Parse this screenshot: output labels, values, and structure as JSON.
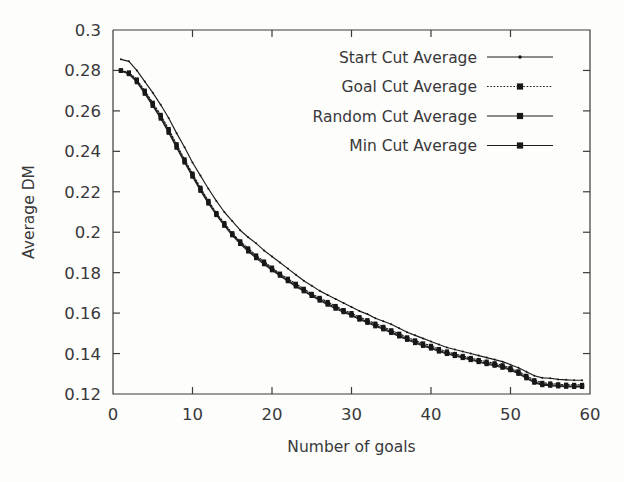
{
  "chart_data": {
    "type": "line",
    "title": "",
    "xlabel": "Number of goals",
    "ylabel": "Average DM",
    "xlim": [
      0,
      60
    ],
    "ylim": [
      0.12,
      0.3
    ],
    "xticks": [
      "0",
      "10",
      "20",
      "30",
      "40",
      "50",
      "60"
    ],
    "xtick_values": [
      0,
      10,
      20,
      30,
      40,
      50,
      60
    ],
    "yticks": [
      "0.12",
      "0.14",
      "0.16",
      "0.18",
      "0.2",
      "0.22",
      "0.24",
      "0.26",
      "0.28",
      "0.3"
    ],
    "ytick_values": [
      0.12,
      0.14,
      0.16,
      0.18,
      0.2,
      0.22,
      0.24,
      0.26,
      0.28,
      0.3
    ],
    "grid": false,
    "legend_position": "top-right",
    "x": [
      1,
      2,
      3,
      4,
      5,
      6,
      7,
      8,
      9,
      10,
      11,
      12,
      13,
      14,
      15,
      16,
      17,
      18,
      19,
      20,
      21,
      22,
      23,
      24,
      25,
      26,
      27,
      28,
      29,
      30,
      31,
      32,
      33,
      34,
      35,
      36,
      37,
      38,
      39,
      40,
      41,
      42,
      43,
      44,
      45,
      46,
      47,
      48,
      49,
      50,
      51,
      52,
      53,
      54,
      55,
      56,
      57,
      58,
      59
    ],
    "series": [
      {
        "name": "Start Cut Average",
        "line_style": "solid",
        "marker": "small-dot",
        "values": [
          0.2855,
          0.2845,
          0.28,
          0.2745,
          0.269,
          0.263,
          0.2565,
          0.249,
          0.242,
          0.2345,
          0.228,
          0.2215,
          0.2155,
          0.21,
          0.2055,
          0.201,
          0.1975,
          0.1945,
          0.191,
          0.188,
          0.185,
          0.182,
          0.179,
          0.176,
          0.1735,
          0.171,
          0.169,
          0.167,
          0.165,
          0.163,
          0.161,
          0.1595,
          0.1575,
          0.156,
          0.1545,
          0.1525,
          0.1505,
          0.149,
          0.1475,
          0.146,
          0.1445,
          0.143,
          0.142,
          0.141,
          0.14,
          0.139,
          0.138,
          0.137,
          0.136,
          0.1345,
          0.133,
          0.131,
          0.129,
          0.128,
          0.1278,
          0.1272,
          0.127,
          0.1268,
          0.1268
        ]
      },
      {
        "name": "Goal Cut Average",
        "line_style": "dotted",
        "marker": "square",
        "values": [
          0.28,
          0.279,
          0.2755,
          0.27,
          0.264,
          0.258,
          0.251,
          0.2435,
          0.236,
          0.229,
          0.222,
          0.2155,
          0.2095,
          0.2045,
          0.1995,
          0.1955,
          0.192,
          0.1885,
          0.1855,
          0.1825,
          0.1795,
          0.177,
          0.1745,
          0.172,
          0.1695,
          0.1675,
          0.1655,
          0.1635,
          0.1615,
          0.16,
          0.158,
          0.1565,
          0.1548,
          0.1532,
          0.1515,
          0.1498,
          0.148,
          0.1465,
          0.145,
          0.1438,
          0.1422,
          0.141,
          0.1398,
          0.1388,
          0.1378,
          0.1368,
          0.136,
          0.1352,
          0.1342,
          0.1328,
          0.1312,
          0.129,
          0.1268,
          0.1255,
          0.1252,
          0.1248,
          0.1246,
          0.1245,
          0.1245
        ]
      },
      {
        "name": "Random Cut Average",
        "line_style": "solid",
        "marker": "square",
        "values": [
          0.28,
          0.2785,
          0.2748,
          0.2692,
          0.2632,
          0.257,
          0.25,
          0.2425,
          0.2352,
          0.2282,
          0.2212,
          0.2148,
          0.209,
          0.2038,
          0.199,
          0.1948,
          0.1912,
          0.1878,
          0.1848,
          0.1818,
          0.179,
          0.1762,
          0.1738,
          0.1712,
          0.1688,
          0.1668,
          0.1648,
          0.1628,
          0.161,
          0.1592,
          0.1572,
          0.1558,
          0.154,
          0.1525,
          0.1508,
          0.149,
          0.1472,
          0.1458,
          0.1442,
          0.143,
          0.1415,
          0.1402,
          0.1392,
          0.1382,
          0.1372,
          0.1362,
          0.1352,
          0.1345,
          0.1335,
          0.1322,
          0.1305,
          0.1282,
          0.126,
          0.1248,
          0.1245,
          0.1242,
          0.124,
          0.1238,
          0.1238
        ]
      },
      {
        "name": "Min Cut Average",
        "line_style": "solid",
        "marker": "square",
        "values": [
          0.2798,
          0.2782,
          0.2742,
          0.2685,
          0.2625,
          0.2562,
          0.2492,
          0.2418,
          0.2345,
          0.2275,
          0.2205,
          0.2142,
          0.2085,
          0.2032,
          0.1985,
          0.1942,
          0.1905,
          0.1872,
          0.1842,
          0.1812,
          0.1785,
          0.1758,
          0.1732,
          0.1708,
          0.1685,
          0.1662,
          0.1642,
          0.1622,
          0.1605,
          0.1588,
          0.1568,
          0.1552,
          0.1535,
          0.152,
          0.1502,
          0.1485,
          0.1468,
          0.1452,
          0.1438,
          0.1425,
          0.141,
          0.1398,
          0.1388,
          0.1378,
          0.1368,
          0.1358,
          0.1348,
          0.134,
          0.133,
          0.1318,
          0.13,
          0.1278,
          0.1256,
          0.1244,
          0.1241,
          0.1238,
          0.1236,
          0.1235,
          0.1235
        ]
      }
    ]
  },
  "legend": {
    "items": [
      {
        "label": "Start Cut Average"
      },
      {
        "label": "Goal Cut Average"
      },
      {
        "label": "Random Cut Average"
      },
      {
        "label": "Min Cut Average"
      }
    ]
  },
  "colors": {
    "line": "#1d1d1d",
    "axis": "#3b3b3b",
    "text": "#38383a",
    "background": "#fdfdfb"
  }
}
